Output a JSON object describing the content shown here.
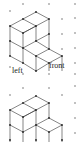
{
  "diagram": {
    "type": "isometric-dot-paper",
    "figures": [
      {
        "name": "top-figure",
        "labels": {
          "left": "left",
          "front": "front"
        },
        "description": "Isometric cube structure: back column 3 cubes tall stepping down to 2 and then 1 toward front-right"
      },
      {
        "name": "bottom-figure",
        "description": "Isometric cube structure: 2-high block on left stepping down to 1 cube on right"
      }
    ]
  }
}
